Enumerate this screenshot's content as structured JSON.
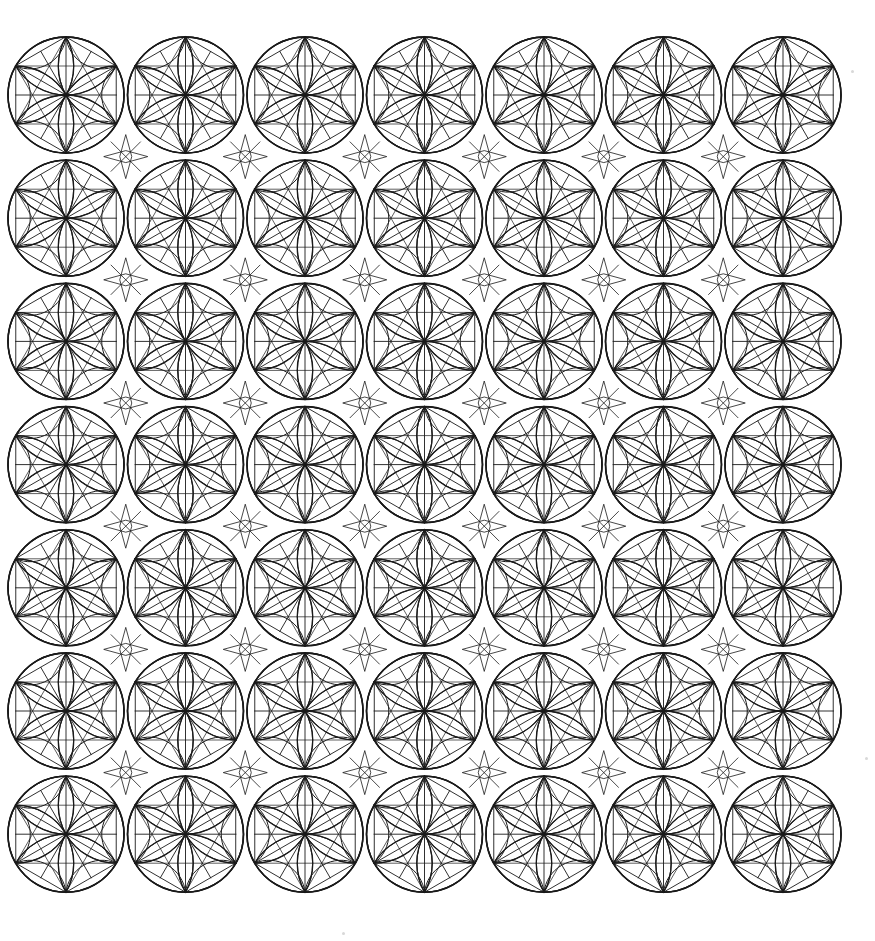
{
  "artwork": {
    "type": "hand-drawn geometric pattern",
    "motif": "flower-of-life rosette inside circle",
    "grid": {
      "rows": 7,
      "cols": 7,
      "origin_x": 66,
      "origin_y": 95,
      "step_x": 119.5,
      "step_y": 123.2,
      "radius": 58
    },
    "colors": {
      "background": "#ffffff",
      "ink": "#1a1a1a"
    },
    "stray_marks": [
      {
        "x": 851,
        "y": 70
      },
      {
        "x": 865,
        "y": 757
      },
      {
        "x": 342,
        "y": 932
      }
    ]
  }
}
